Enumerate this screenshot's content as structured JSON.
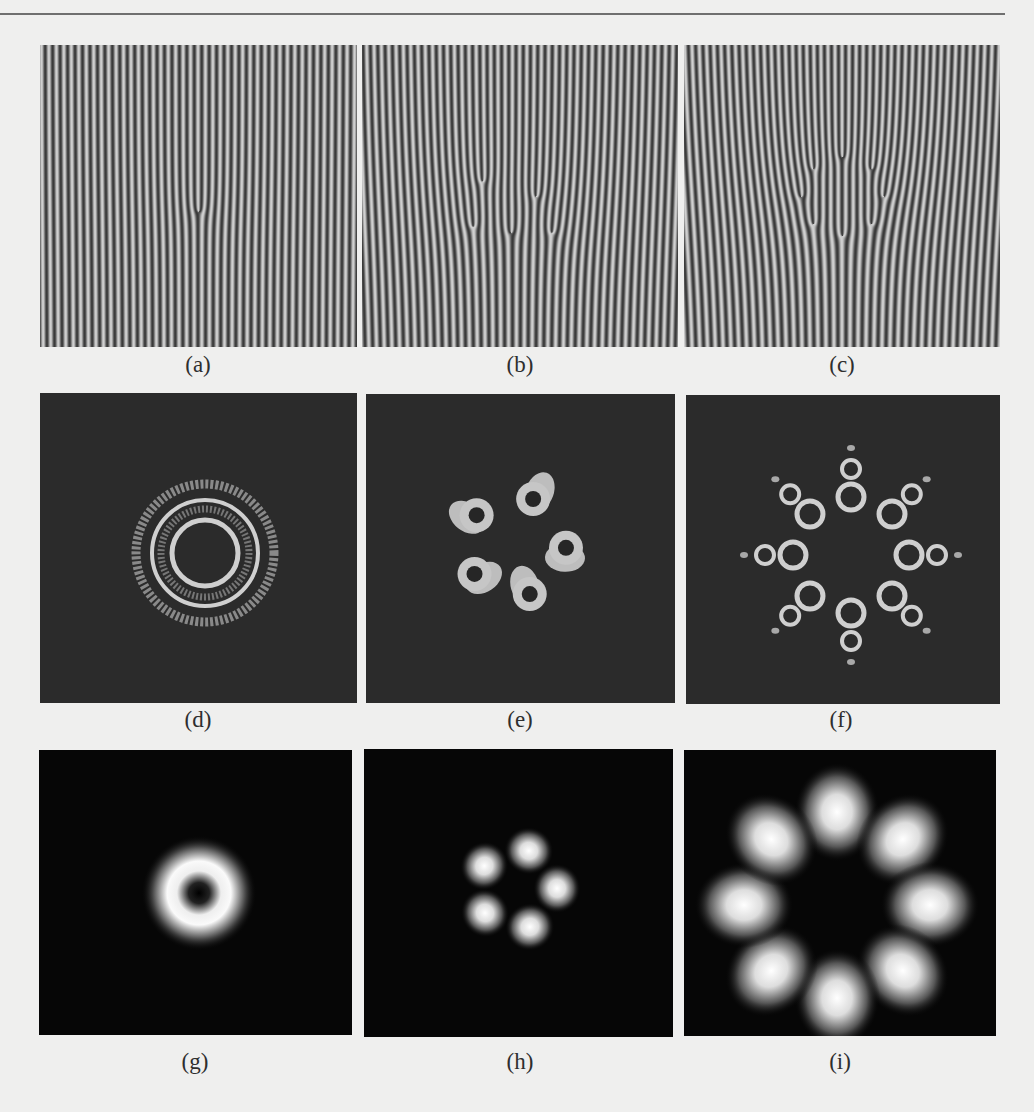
{
  "figure": {
    "panels": [
      {
        "id": "a",
        "label": "(a)",
        "kind": "fork-fringe",
        "topological_charge": 1,
        "description": "Interference fringes with a single fork dislocation"
      },
      {
        "id": "b",
        "label": "(b)",
        "kind": "fork-fringe",
        "topological_charge": 5,
        "description": "Interference fringes with a distorted multi-fork dislocation region"
      },
      {
        "id": "c",
        "label": "(c)",
        "kind": "fork-fringe",
        "topological_charge": 8,
        "description": "Interference fringes with multiple fork dislocations"
      },
      {
        "id": "d",
        "label": "(d)",
        "kind": "ring-contour",
        "ring_count": 3,
        "description": "Concentric ring intensity contours"
      },
      {
        "id": "e",
        "label": "(e)",
        "kind": "lobe-contour",
        "lobe_count": 5,
        "description": "Five hollow lobes arranged around a center"
      },
      {
        "id": "f",
        "label": "(f)",
        "kind": "lobe-contour",
        "lobe_count": 8,
        "description": "Eight-fold pattern of hollow rings with outer satellites"
      },
      {
        "id": "g",
        "label": "(g)",
        "kind": "donut",
        "lobe_count": 1,
        "description": "Single doughnut-shaped intensity spot"
      },
      {
        "id": "h",
        "label": "(h)",
        "kind": "petal",
        "lobe_count": 5,
        "description": "Five bright petals"
      },
      {
        "id": "i",
        "label": "(i)",
        "kind": "petal",
        "lobe_count": 8,
        "description": "Eight bright teardrop petals"
      }
    ]
  },
  "colors": {
    "page": "#efefee",
    "rule": "#6f6f6f",
    "fringe_dark": "#3a3a3a",
    "fringe_light": "#c8c8c8",
    "contour_bg": "#2b2b2b",
    "contour_fg": "#cfcfcf",
    "intensity_bg": "#060606",
    "intensity_fg": "#ffffff",
    "label": "#2e2e2e"
  }
}
